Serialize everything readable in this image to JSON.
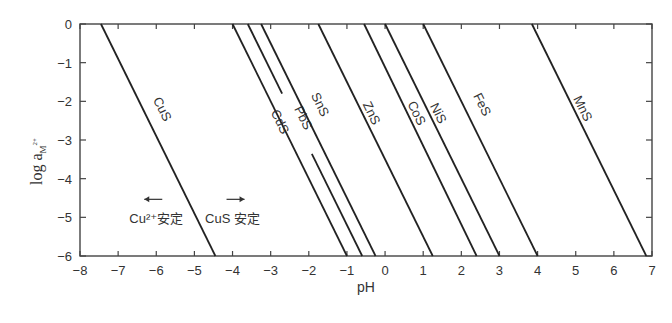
{
  "chart_data": {
    "type": "line",
    "title": "",
    "xlabel": "pH",
    "ylabel": "log a_M2+",
    "ylabel_main": "log a",
    "ylabel_sub": "M",
    "ylabel_sup": "2+",
    "xlim": [
      -8,
      7
    ],
    "ylim": [
      -6,
      0
    ],
    "xticks": [
      -8,
      -7,
      -6,
      -5,
      -4,
      -3,
      -2,
      -1,
      0,
      1,
      2,
      3,
      4,
      5,
      6,
      7
    ],
    "yticks": [
      0,
      -1,
      -2,
      -3,
      -4,
      -5,
      -6
    ],
    "grid": false,
    "legend": "none (inline line labels)",
    "series": [
      {
        "name": "CuS",
        "x": [
          -7.45,
          -4.45
        ],
        "y": [
          0,
          -6
        ]
      },
      {
        "name": "CdS",
        "x": [
          -4.0,
          -1.0
        ],
        "y": [
          0,
          -6
        ]
      },
      {
        "name": "PbS",
        "x": [
          -3.6,
          -0.6
        ],
        "y": [
          0,
          -6
        ]
      },
      {
        "name": "SnS",
        "x": [
          -3.25,
          -0.25
        ],
        "y": [
          0,
          -6
        ]
      },
      {
        "name": "ZnS",
        "x": [
          -1.75,
          1.25
        ],
        "y": [
          0,
          -6
        ]
      },
      {
        "name": "CoS",
        "x": [
          -0.55,
          2.4
        ],
        "y": [
          0,
          -6
        ]
      },
      {
        "name": "NiS",
        "x": [
          0.0,
          3.0
        ],
        "y": [
          0,
          -6
        ]
      },
      {
        "name": "FeS",
        "x": [
          1.0,
          4.0
        ],
        "y": [
          0,
          -6
        ]
      },
      {
        "name": "MnS",
        "x": [
          3.85,
          6.85
        ],
        "y": [
          0,
          -6
        ]
      }
    ],
    "annotations": [
      {
        "text": "Cu²⁺安定",
        "arrow": "left",
        "x": -6,
        "y": -5.0
      },
      {
        "text": "CuS 安定",
        "arrow": "right",
        "x": -4.0,
        "y": -5.0
      }
    ]
  }
}
